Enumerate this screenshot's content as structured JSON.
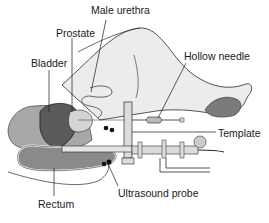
{
  "diagram": {
    "labels": {
      "male_urethra": "Male urethra",
      "prostate": "Prostate",
      "bladder": "Bladder",
      "hollow_needle": "Hollow needle",
      "template": "Template",
      "rectum": "Rectum",
      "ultrasound_probe": "Ultrasound probe"
    },
    "colors": {
      "body_fill": "#ececec",
      "outline": "#2a2a2a",
      "bladder_fill": "#5a5a5a",
      "tissue_fill": "#9a9a9a",
      "rectum_fill": "#8a8a8a",
      "foot_sole": "#7a7a7a",
      "instrument_fill": "#dcdcdc"
    }
  }
}
